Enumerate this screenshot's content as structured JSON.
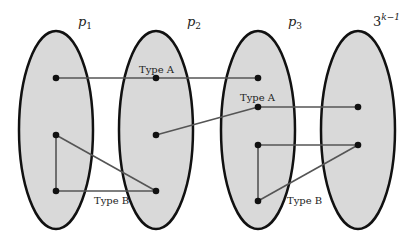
{
  "diagram": {
    "partitions": [
      {
        "label": "p",
        "sub": "1",
        "sup": "",
        "cx": 56
      },
      {
        "label": "p",
        "sub": "2",
        "sup": "",
        "cx": 156
      },
      {
        "label": "p",
        "sub": "3",
        "sup": "",
        "cx": 258
      },
      {
        "label": "3",
        "sub": "",
        "sup": "k−1",
        "cx": 358
      }
    ],
    "edge_labels": {
      "type_a_1": "Type A",
      "type_a_2": "Type A",
      "type_b_1": "Type B",
      "type_b_2": "Type B"
    },
    "colors": {
      "fill": "#d9d9d9",
      "stroke": "#111111",
      "edge": "#555555"
    }
  }
}
